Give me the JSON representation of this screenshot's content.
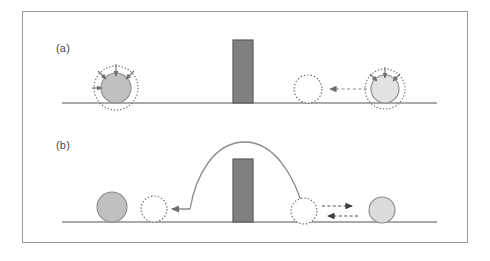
{
  "figure": {
    "width": 490,
    "height": 261,
    "background_color": "#ffffff",
    "frame_color": "#9a9a9a"
  },
  "panels": [
    {
      "id": "a",
      "label": "(a)",
      "description": "Classical reflection: particle approaches barrier and bounces back",
      "ground_line": {
        "x1": 62,
        "x2": 437,
        "y": 103,
        "color": "#8c8c8c"
      },
      "barrier": {
        "x": 233,
        "y": 40,
        "width": 20,
        "height": 63,
        "fill": "#808080",
        "stroke": "#5a5a5a"
      },
      "elements": [
        {
          "name": "vibrating-particle-left",
          "type": "filled-circle-with-halo",
          "cx": 116,
          "cy": 88,
          "r": 15,
          "fill": "#c0c0c0",
          "stroke": "#8a8a8a",
          "halo_r": 22,
          "halo_color": "#6e6e6e",
          "arrow_count": 4
        },
        {
          "name": "ghost-particle-mid",
          "type": "dotted-empty-circle",
          "cx": 308,
          "cy": 89,
          "r": 14,
          "fill": "#ffffff",
          "stroke": "#6e6e6e"
        },
        {
          "name": "motion-arrow-leftward",
          "type": "dashed-arrow",
          "x1": 378,
          "y1": 89,
          "x2": 330,
          "y2": 89,
          "direction": "left",
          "color": "#6e6e6e"
        },
        {
          "name": "vibrating-particle-right",
          "type": "filled-circle-with-halo",
          "cx": 385,
          "cy": 89,
          "r": 14,
          "fill": "#e2e2e2",
          "stroke": "#8a8a8a",
          "halo_r": 20,
          "halo_color": "#6e6e6e",
          "arrow_count": 3
        }
      ]
    },
    {
      "id": "b",
      "label": "(b)",
      "description": "Tunneling / barrier crossing: particle traverses the barrier along an arc trajectory",
      "ground_line": {
        "x1": 62,
        "x2": 437,
        "y": 222,
        "color": "#8c8c8c"
      },
      "barrier": {
        "x": 233,
        "y": 159,
        "width": 20,
        "height": 63,
        "fill": "#808080",
        "stroke": "#5a5a5a"
      },
      "elements": [
        {
          "name": "final-particle-left",
          "type": "filled-circle",
          "cx": 112,
          "cy": 207,
          "r": 15,
          "fill": "#c0c0c0",
          "stroke": "#8a8a8a"
        },
        {
          "name": "ghost-particle-landing",
          "type": "dotted-empty-circle",
          "cx": 154,
          "cy": 209,
          "r": 13,
          "fill": "#ffffff",
          "stroke": "#6e6e6e"
        },
        {
          "name": "landing-arrow-leftward",
          "type": "solid-arrow",
          "x1": 190,
          "y1": 209,
          "x2": 172,
          "y2": 209,
          "direction": "left",
          "color": "#6e6e6e"
        },
        {
          "name": "trajectory-arc",
          "type": "arc",
          "start_x": 190,
          "start_y": 209,
          "apex_x": 245,
          "apex_y": 142,
          "end_x": 305,
          "end_y": 211,
          "color": "#8a8a8a"
        },
        {
          "name": "ghost-particle-launch",
          "type": "dotted-empty-circle",
          "cx": 304,
          "cy": 211,
          "r": 13,
          "fill": "#ffffff",
          "stroke": "#6e6e6e"
        },
        {
          "name": "motion-arrow-rightward",
          "type": "dashed-arrow",
          "x1": 325,
          "y1": 206,
          "x2": 358,
          "y2": 206,
          "direction": "right",
          "color": "#4a4a4a"
        },
        {
          "name": "motion-arrow-return-leftward",
          "type": "dashed-arrow",
          "x1": 355,
          "y1": 216,
          "x2": 322,
          "y2": 216,
          "direction": "left",
          "color": "#4a4a4a"
        },
        {
          "name": "incoming-particle-right",
          "type": "filled-circle",
          "cx": 382,
          "cy": 210,
          "r": 13,
          "fill": "#dcdcdc",
          "stroke": "#8a8a8a"
        }
      ]
    }
  ],
  "colors": {
    "particle_dark_fill": "#c0c0c0",
    "particle_light_fill": "#e2e2e2",
    "barrier_fill": "#808080",
    "barrier_stroke": "#5a5a5a",
    "line_gray": "#8c8c8c",
    "arrow_gray": "#6e6e6e",
    "arrow_dark": "#4a4a4a",
    "frame_gray": "#9a9a9a",
    "label_text": "#4a4a4a"
  }
}
